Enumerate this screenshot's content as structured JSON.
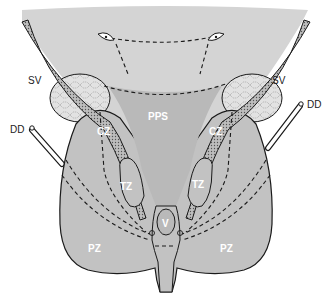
{
  "diagram": {
    "labels": {
      "sv_left": "SV",
      "sv_right": "SV",
      "dd_left": "DD",
      "dd_right": "DD",
      "pps": "PPS",
      "cz_left": "CZ",
      "cz_right": "CZ",
      "tz_left": "TZ",
      "tz_right": "TZ",
      "v": "V",
      "pz_left": "PZ",
      "pz_right": "PZ"
    },
    "colors": {
      "bladder_fill": "#d4d4d4",
      "gland_fill": "#c2c2c2",
      "pps_fill": "#b9b9b9",
      "outline": "#1a1a1a",
      "background": "#ffffff"
    }
  }
}
